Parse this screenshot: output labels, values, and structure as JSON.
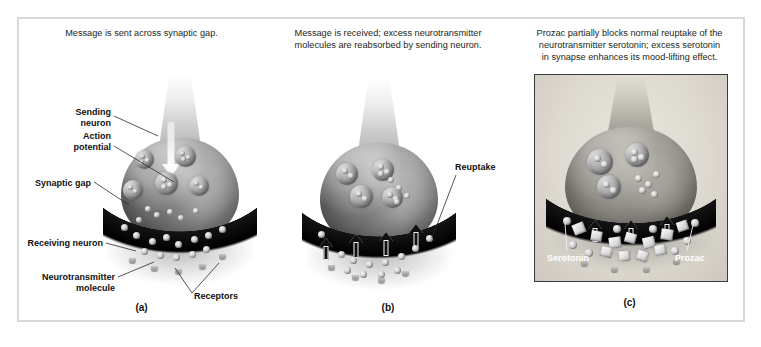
{
  "figure": {
    "border_color": "#d8d8d6",
    "background": "#ffffff"
  },
  "panels": [
    {
      "id": "a",
      "letter": "(a)",
      "caption": "Message is sent across synaptic gap.",
      "caption_lines": [
        "Message is sent across synaptic gap."
      ],
      "labels": [
        {
          "name": "sending-neuron",
          "text_lines": [
            "Sending",
            "neuron"
          ],
          "align": "right"
        },
        {
          "name": "action-potential",
          "text_lines": [
            "Action",
            "potential"
          ],
          "align": "right"
        },
        {
          "name": "synaptic-gap",
          "text_lines": [
            "Synaptic gap"
          ],
          "align": "right"
        },
        {
          "name": "receiving-neuron",
          "text_lines": [
            "Receiving neuron"
          ],
          "align": "right"
        },
        {
          "name": "neurotransmitter-molecule",
          "text_lines": [
            "Neurotransmitter",
            "molecule"
          ],
          "align": "right"
        },
        {
          "name": "receptors",
          "text_lines": [
            "Receptors"
          ],
          "align": "left"
        }
      ]
    },
    {
      "id": "b",
      "letter": "(b)",
      "caption": "Message is received; excess neurotransmitter molecules are reabsorbed by sending neuron.",
      "caption_lines": [
        "Message is received; excess neurotransmitter",
        "molecules are reabsorbed by sending neuron."
      ],
      "labels": [
        {
          "name": "reuptake",
          "text_lines": [
            "Reuptake"
          ],
          "align": "left"
        }
      ]
    },
    {
      "id": "c",
      "letter": "(c)",
      "caption": "Prozac partially blocks normal reuptake of the neurotransmitter serotonin; excess serotonin in synapse enhances its mood-lifting effect.",
      "caption_lines": [
        "Prozac partially blocks normal reuptake of the",
        "neurotransmitter serotonin; excess serotonin",
        "in synapse enhances its mood-lifting effect."
      ],
      "framed": true,
      "labels": [
        {
          "name": "serotonin",
          "text_lines": [
            "Serotonin"
          ],
          "align": "left",
          "on_image": true
        },
        {
          "name": "prozac",
          "text_lines": [
            "Prozac"
          ],
          "align": "left",
          "on_image": true
        }
      ]
    }
  ],
  "colors": {
    "text": "#231f20",
    "label": "#111111",
    "label_on_image": "#ffffff",
    "membrane": "#0c0c0c",
    "terminal_light": "#fdfdfd",
    "terminal_dark": "#6c6c6c",
    "panel_c_frame": "#3a3a3a",
    "panel_c_background": "#ded9d0"
  }
}
